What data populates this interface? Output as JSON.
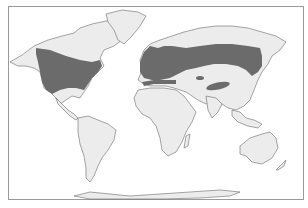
{
  "map": {
    "title": "",
    "projection": "world-equirectangular",
    "colors": {
      "background": "#ffffff",
      "land": "#ececec",
      "coastline": "#6a6a6a",
      "range": "#6b6b6b",
      "frame": "#9a9a9a"
    },
    "layers": [
      {
        "name": "land",
        "description": "World continents"
      },
      {
        "name": "distribution-range",
        "description": "Highlighted range across North America, Europe and northern Asia"
      }
    ],
    "range_regions": [
      "North America (temperate band)",
      "Europe",
      "Northern Asia (Siberian band)",
      "Central Asia patch",
      "Central Asia small patch",
      "North Africa coastal band"
    ]
  }
}
